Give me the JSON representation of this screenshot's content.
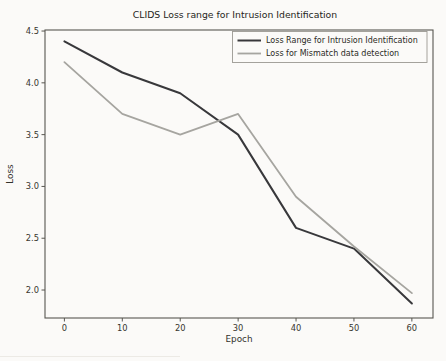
{
  "chart_data": {
    "type": "line",
    "title": "CLIDS Loss range for Intrusion Identification",
    "xlabel": "Epoch",
    "ylabel": "Loss",
    "x": [
      0,
      10,
      20,
      30,
      40,
      50,
      60
    ],
    "series": [
      {
        "name": "Loss Range for Intrusion Identification",
        "values": [
          4.4,
          4.1,
          3.9,
          3.5,
          2.6,
          2.4,
          1.87
        ],
        "color": "#38383b",
        "width": 2.0
      },
      {
        "name": "Loss for Mismatch data detection",
        "values": [
          4.2,
          3.7,
          3.5,
          3.7,
          2.9,
          2.42,
          1.97
        ],
        "color": "#a6a5a0",
        "width": 1.8
      }
    ],
    "xlim": [
      -3.35,
      63.65
    ],
    "ylim": [
      1.73,
      4.51
    ],
    "xticks": [
      0,
      10,
      20,
      30,
      40,
      50,
      60
    ],
    "xtick_labels": [
      "0",
      "10",
      "20",
      "30",
      "40",
      "50",
      "60"
    ],
    "yticks": [
      2.0,
      2.5,
      3.0,
      3.5,
      4.0,
      4.5
    ],
    "ytick_labels": [
      "2.0",
      "2.5",
      "3.0",
      "3.5",
      "4.0",
      "4.5"
    ],
    "grid": false,
    "legend_position": "upper right"
  },
  "colors": {
    "background": "#fbfaf8",
    "axis_spine": "#585650",
    "tick": "#585650",
    "legend_border": "#9b9992",
    "legend_background": "#fbfaf8"
  }
}
